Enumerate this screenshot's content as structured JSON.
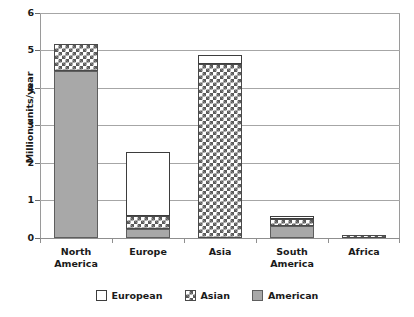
{
  "chart_data": {
    "type": "bar",
    "title": "",
    "subtitle": "",
    "xlabel": "",
    "ylabel": "Million units/year",
    "ylim": [
      0,
      6
    ],
    "yticks": [
      0,
      1,
      2,
      3,
      4,
      5,
      6
    ],
    "ytick_labels": [
      "0",
      "1",
      "2",
      "3",
      "4",
      "5",
      "6"
    ],
    "grid": true,
    "stacked": true,
    "legend_position": "bottom",
    "categories": [
      "North America",
      "Europe",
      "Asia",
      "South America",
      "Africa"
    ],
    "category_label_lines": [
      [
        "North",
        "America"
      ],
      [
        "Europe",
        ""
      ],
      [
        "Asia",
        ""
      ],
      [
        "South",
        "America"
      ],
      [
        "Africa",
        ""
      ]
    ],
    "series": [
      {
        "name": "American",
        "fill": "solid-gray",
        "color": "#a8a8a8",
        "values": [
          4.45,
          0.23,
          0.0,
          0.32,
          0.0
        ]
      },
      {
        "name": "Asian",
        "fill": "checkerboard",
        "color": "#5a5a5a",
        "values": [
          0.72,
          0.35,
          4.65,
          0.2,
          0.09
        ]
      },
      {
        "name": "European",
        "fill": "white",
        "color": "#ffffff",
        "values": [
          0.0,
          1.72,
          0.22,
          0.08,
          0.0
        ]
      }
    ],
    "stack_order_bottom_to_top": [
      "American",
      "Asian",
      "European"
    ],
    "totals": [
      5.17,
      2.3,
      4.87,
      0.6,
      0.09
    ]
  },
  "legend": {
    "items": [
      {
        "label": "European",
        "swatch": "white-square-icon"
      },
      {
        "label": "Asian",
        "swatch": "checkered-square-icon"
      },
      {
        "label": "American",
        "swatch": "gray-square-icon"
      }
    ]
  },
  "axes": {
    "y_title": "Million units/year",
    "y_tick_labels": [
      "6",
      "5",
      "4",
      "3",
      "2",
      "1",
      "0"
    ]
  }
}
